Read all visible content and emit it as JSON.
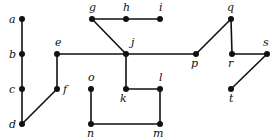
{
  "diagram": {
    "type": "graph",
    "directed": false,
    "colors": {
      "edge": "#111111",
      "node": "#111111",
      "background": "#ffffff"
    },
    "nodes": [
      {
        "id": "a",
        "label": "a",
        "x": 22,
        "y": 19,
        "lx": 9,
        "ly": 23
      },
      {
        "id": "b",
        "label": "b",
        "x": 22,
        "y": 54,
        "lx": 9,
        "ly": 58
      },
      {
        "id": "c",
        "label": "c",
        "x": 22,
        "y": 89,
        "lx": 9,
        "ly": 93
      },
      {
        "id": "d",
        "label": "d",
        "x": 22,
        "y": 124,
        "lx": 9,
        "ly": 128
      },
      {
        "id": "e",
        "label": "e",
        "x": 57,
        "y": 54,
        "lx": 55,
        "ly": 46
      },
      {
        "id": "f",
        "label": "f",
        "x": 57,
        "y": 89,
        "lx": 63,
        "ly": 93
      },
      {
        "id": "g",
        "label": "g",
        "x": 92,
        "y": 19,
        "lx": 89,
        "ly": 11
      },
      {
        "id": "h",
        "label": "h",
        "x": 126,
        "y": 19,
        "lx": 123,
        "ly": 11
      },
      {
        "id": "i",
        "label": "i",
        "x": 160,
        "y": 19,
        "lx": 159,
        "ly": 11
      },
      {
        "id": "j",
        "label": "j",
        "x": 126,
        "y": 54,
        "lx": 131,
        "ly": 46
      },
      {
        "id": "k",
        "label": "k",
        "x": 126,
        "y": 89,
        "lx": 120,
        "ly": 102
      },
      {
        "id": "l",
        "label": "l",
        "x": 160,
        "y": 89,
        "lx": 159,
        "ly": 81
      },
      {
        "id": "m",
        "label": "m",
        "x": 160,
        "y": 124,
        "lx": 153,
        "ly": 137
      },
      {
        "id": "n",
        "label": "n",
        "x": 91,
        "y": 124,
        "lx": 87,
        "ly": 137
      },
      {
        "id": "o",
        "label": "o",
        "x": 91,
        "y": 89,
        "lx": 88,
        "ly": 81
      },
      {
        "id": "p",
        "label": "p",
        "x": 196,
        "y": 54,
        "lx": 191,
        "ly": 67
      },
      {
        "id": "q",
        "label": "q",
        "x": 231,
        "y": 19,
        "lx": 227,
        "ly": 11
      },
      {
        "id": "r",
        "label": "r",
        "x": 232,
        "y": 54,
        "lx": 228,
        "ly": 67
      },
      {
        "id": "s",
        "label": "s",
        "x": 267,
        "y": 54,
        "lx": 263,
        "ly": 46
      },
      {
        "id": "t",
        "label": "t",
        "x": 231,
        "y": 89,
        "lx": 229,
        "ly": 102
      }
    ],
    "edges": [
      [
        "a",
        "b"
      ],
      [
        "b",
        "c"
      ],
      [
        "c",
        "d"
      ],
      [
        "d",
        "f"
      ],
      [
        "f",
        "e"
      ],
      [
        "e",
        "j"
      ],
      [
        "g",
        "j"
      ],
      [
        "g",
        "h"
      ],
      [
        "h",
        "i"
      ],
      [
        "j",
        "k"
      ],
      [
        "k",
        "l"
      ],
      [
        "l",
        "m"
      ],
      [
        "m",
        "n"
      ],
      [
        "n",
        "o"
      ],
      [
        "j",
        "p"
      ],
      [
        "p",
        "q"
      ],
      [
        "q",
        "r"
      ],
      [
        "r",
        "s"
      ],
      [
        "s",
        "t"
      ]
    ]
  }
}
